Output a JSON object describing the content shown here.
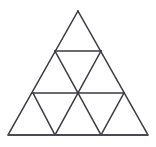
{
  "figure": {
    "name": "subdivided-equilateral-triangle",
    "title": "Equilateral triangle subdivided into nine smaller triangles",
    "background_color": "#ffffff",
    "line_color": "#3a3a42",
    "base_line_color": "#4a4a52",
    "line_width": 1.5,
    "base_line_width": 2.2,
    "canvas": {
      "width": 156,
      "height": 147
    },
    "rows": 3,
    "small_triangle_count": 9,
    "upward_triangle_count": 6,
    "downward_triangle_count": 3
  },
  "geometry": {
    "apex": {
      "x": 78,
      "y": 11
    },
    "bottom_left": {
      "x": 8,
      "y": 135
    },
    "bottom_right": {
      "x": 148,
      "y": 135
    },
    "row_divider_y": [
      51,
      93
    ],
    "vertices": {
      "row0": [
        {
          "x": 78,
          "y": 11
        }
      ],
      "row1": [
        {
          "x": 55,
          "y": 51
        },
        {
          "x": 101,
          "y": 51
        }
      ],
      "row2": [
        {
          "x": 33,
          "y": 93
        },
        {
          "x": 78,
          "y": 93
        },
        {
          "x": 124,
          "y": 93
        }
      ],
      "row3": [
        {
          "x": 8,
          "y": 135
        },
        {
          "x": 55,
          "y": 135
        },
        {
          "x": 101,
          "y": 135
        },
        {
          "x": 148,
          "y": 135
        }
      ]
    },
    "horizontal_segments": [
      {
        "label": "upper-divider",
        "x1": 55,
        "y1": 51,
        "x2": 101,
        "y2": 51
      },
      {
        "label": "lower-divider",
        "x1": 33,
        "y1": 93,
        "x2": 124,
        "y2": 93
      },
      {
        "label": "base",
        "x1": 8,
        "y1": 135,
        "x2": 148,
        "y2": 135
      }
    ],
    "left_leaning_edges": [
      {
        "label": "outer-left-edge",
        "x1": 78,
        "y1": 11,
        "x2": 8,
        "y2": 135
      },
      {
        "label": "inner-left-1",
        "x1": 101,
        "y1": 51,
        "x2": 55,
        "y2": 135
      },
      {
        "label": "inner-left-2",
        "x1": 124,
        "y1": 93,
        "x2": 101,
        "y2": 135
      }
    ],
    "right_leaning_edges": [
      {
        "label": "outer-right-edge",
        "x1": 78,
        "y1": 11,
        "x2": 148,
        "y2": 135
      },
      {
        "label": "inner-right-1",
        "x1": 55,
        "y1": 51,
        "x2": 101,
        "y2": 135
      },
      {
        "label": "inner-right-2",
        "x1": 33,
        "y1": 93,
        "x2": 55,
        "y2": 135
      }
    ]
  }
}
